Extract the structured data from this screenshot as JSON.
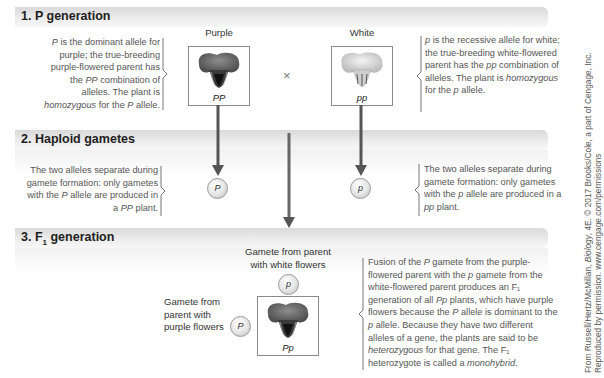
{
  "sections": [
    {
      "number": "1.",
      "title": "P generation",
      "left_label": "Purple",
      "right_label": "White",
      "cross_symbol": "×",
      "left_box_genotype": "PP",
      "right_box_genotype": "pp",
      "left_description": [
        {
          "t": "P",
          "i": true
        },
        {
          "t": " is the dominant allele for purple; the true-breeding purple-flowered parent has the ",
          "i": false
        },
        {
          "t": "PP",
          "i": true
        },
        {
          "t": " combination of alleles. The plant is ",
          "i": false
        },
        {
          "t": "homozygous",
          "i": true
        },
        {
          "t": " for the ",
          "i": false
        },
        {
          "t": "P",
          "i": true
        },
        {
          "t": " allele.",
          "i": false
        }
      ],
      "right_description": [
        {
          "t": "p",
          "i": true
        },
        {
          "t": " is the recessive allele for white; the true-breeding white-flowered parent has the ",
          "i": false
        },
        {
          "t": "pp",
          "i": true
        },
        {
          "t": " combination of alleles. The plant is ",
          "i": false
        },
        {
          "t": "homozygous",
          "i": true
        },
        {
          "t": " for the ",
          "i": false
        },
        {
          "t": "p",
          "i": true
        },
        {
          "t": " allele.",
          "i": false
        }
      ]
    },
    {
      "number": "2.",
      "title": "Haploid gametes",
      "left_gamete": "P",
      "right_gamete": "p",
      "left_description": [
        {
          "t": "The two alleles separate during gamete formation: only gametes with the ",
          "i": false
        },
        {
          "t": "P",
          "i": true
        },
        {
          "t": " allele are produced in a ",
          "i": false
        },
        {
          "t": "PP",
          "i": true
        },
        {
          "t": " plant.",
          "i": false
        }
      ],
      "right_description": [
        {
          "t": "The two alleles separate during gamete formation: only gametes with the ",
          "i": false
        },
        {
          "t": "p",
          "i": true
        },
        {
          "t": " allele are produced in a ",
          "i": false
        },
        {
          "t": "pp",
          "i": true
        },
        {
          "t": " plant.",
          "i": false
        }
      ]
    },
    {
      "number": "3.",
      "title_prefix": "F",
      "title_sub": "1",
      "title_suffix": " generation",
      "top_gamete_label": "Gamete from parent with white flowers",
      "top_gamete": "p",
      "left_gamete_label": "Gamete from parent with purple flowers",
      "left_gamete": "P",
      "box_genotype": "Pp",
      "description": [
        {
          "t": "Fusion of the ",
          "i": false
        },
        {
          "t": "P",
          "i": true
        },
        {
          "t": " gamete from the purple-flowered parent with the ",
          "i": false
        },
        {
          "t": "p",
          "i": true
        },
        {
          "t": " gamete from the white-flowered parent produces an F₁ generation of all ",
          "i": false
        },
        {
          "t": "Pp",
          "i": true
        },
        {
          "t": " plants, which have purple flowers because the ",
          "i": false
        },
        {
          "t": "P",
          "i": true
        },
        {
          "t": " allele is dominant to the ",
          "i": false
        },
        {
          "t": "p",
          "i": true
        },
        {
          "t": " allele. Because they have two different alleles of a gene, the plants are said to be ",
          "i": false
        },
        {
          "t": "heterozygous",
          "i": true
        },
        {
          "t": " for that gene. The F₁ heterozygote is called a ",
          "i": false
        },
        {
          "t": "monohybrid",
          "i": true
        },
        {
          "t": ".",
          "i": false
        }
      ]
    }
  ],
  "credit": {
    "line1_prefix": "From Russell/Hertz/McMillan, ",
    "line1_italic": "Biology",
    "line1_suffix": ", 4E. © 2017 Brooks/Cole, a part of Cengage, Inc.",
    "line2": "Reproduced by permission. www.cengage.com/permissions"
  },
  "colors": {
    "purple_flower": "#6b6b6b",
    "white_flower": "#d6d6d6",
    "arrow": "#555555",
    "band": "#e2e2e2"
  }
}
